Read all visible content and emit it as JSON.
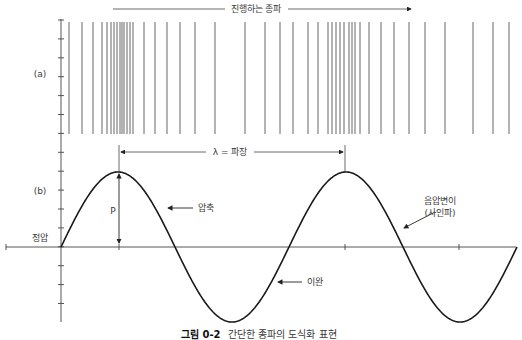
{
  "figure": {
    "title_arrow_label": "진행하는 종파",
    "panel_a_label": "(a)",
    "panel_b_label": "(b)",
    "wavelength_label": "λ = 파장",
    "amplitude_label": "P",
    "baseline_label": "정압",
    "compression_label": "압축",
    "rarefaction_label": "이완",
    "pressure_label_line1": "음압변이",
    "pressure_label_line2": "(사인파)",
    "caption_prefix": "그림 0-2",
    "caption_text": "간단한 종파의 도식화 표현"
  },
  "colors": {
    "line": "#555555",
    "wave": "#1a1a1a",
    "text": "#3a3a3a"
  },
  "chart_data": {
    "type": "line",
    "title": "간단한 종파의 도식화 표현",
    "panels": [
      {
        "label": "(a)",
        "kind": "compression-lines",
        "line_x_positions": [
          69,
          82,
          93,
          102,
          107,
          111,
          114,
          117,
          120,
          122,
          124,
          127,
          130,
          133,
          144,
          155,
          167,
          180,
          195,
          215,
          245,
          265,
          280,
          293,
          308,
          318,
          328,
          332,
          336,
          340,
          344,
          349,
          352,
          355,
          360,
          369,
          381,
          394,
          409,
          425,
          445,
          473,
          493,
          509
        ]
      },
      {
        "label": "(b)",
        "kind": "sine",
        "series": [
          {
            "name": "음압변이 (사인파)",
            "x": [
              0,
              0.25,
              0.5,
              0.75,
              1.0,
              1.25,
              1.5,
              1.75,
              2.0
            ],
            "values": [
              0,
              1,
              0,
              -1,
              0,
              1,
              0,
              -1,
              0
            ]
          }
        ],
        "xlabel": "",
        "ylabel": "",
        "annotations": [
          "λ = 파장",
          "P",
          "압축",
          "이완",
          "정압",
          "음압변이 (사인파)"
        ],
        "periods": 2
      }
    ]
  }
}
